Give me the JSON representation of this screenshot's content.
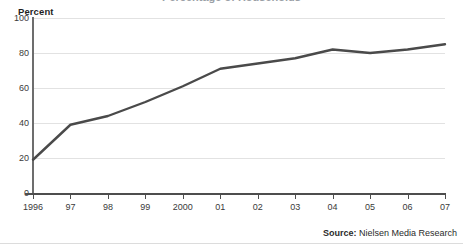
{
  "figure": {
    "cutoff_title": "Percentage of Households",
    "axis_title": "Percent",
    "source_label": "Source:",
    "source_text": " Nielsen Media Research",
    "line_color": "#4a4a4a",
    "grid_color": "#e2e2e2",
    "axis_color": "#4d4d4d"
  },
  "chart_data": {
    "type": "line",
    "title": "",
    "xlabel": "",
    "ylabel": "Percent",
    "ylim": [
      0,
      100
    ],
    "yticks": [
      0,
      20,
      40,
      60,
      80,
      100
    ],
    "ytick_labels": [
      "0",
      "20",
      "40",
      "60",
      "80",
      "100"
    ],
    "grid": true,
    "grid_axis": "y",
    "legend": false,
    "categories": [
      "1996",
      "97",
      "98",
      "99",
      "2000",
      "01",
      "02",
      "03",
      "04",
      "05",
      "06",
      "07"
    ],
    "xtick_labels": [
      "1996",
      "97",
      "98",
      "99",
      "2000",
      "01",
      "02",
      "03",
      "04",
      "05",
      "06",
      "07"
    ],
    "series": [
      {
        "name": "Percent",
        "color": "#4a4a4a",
        "values": [
          19,
          39,
          44,
          52,
          61,
          71,
          74,
          77,
          82,
          80,
          82,
          85
        ]
      }
    ],
    "annotations": [
      "Source: Nielsen Media Research"
    ]
  }
}
